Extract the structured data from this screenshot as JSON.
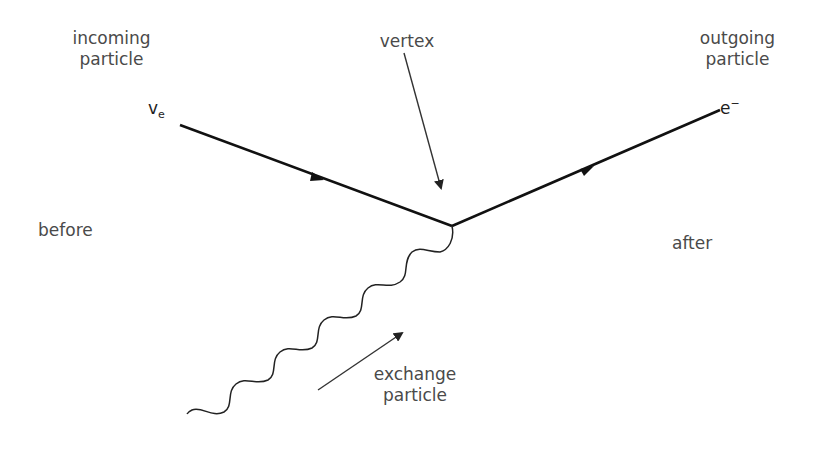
{
  "diagram": {
    "type": "feynman",
    "labels": {
      "incoming_line1": "incoming",
      "incoming_line2": "particle",
      "vertex": "vertex",
      "outgoing_line1": "outgoing",
      "outgoing_line2": "particle",
      "before": "before",
      "after": "after",
      "exchange_line1": "exchange",
      "exchange_line2": "particle"
    },
    "symbols": {
      "incoming_base": "v",
      "incoming_sub": "e",
      "outgoing_base": "e",
      "outgoing_sup": "−"
    },
    "colors": {
      "line": "#111111",
      "text": "#4a4a4a",
      "background": "#ffffff"
    }
  }
}
